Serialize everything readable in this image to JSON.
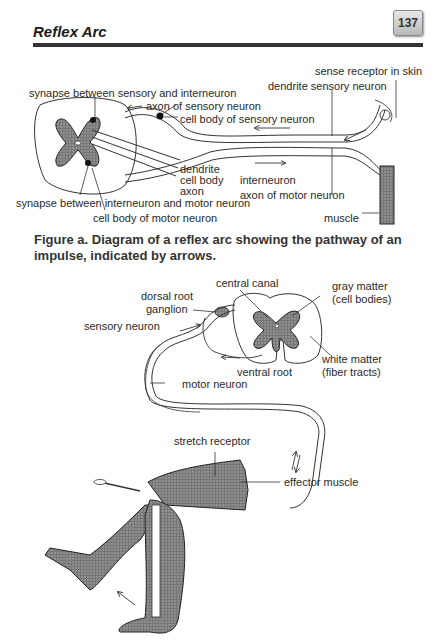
{
  "header": {
    "title": "Reflex Arc",
    "page_number": "137"
  },
  "figure_a": {
    "labels": {
      "sense_receptor": "sense receptor in skin",
      "dendrite_sensory": "dendrite sensory neuron",
      "synapse_sensory_inter": "synapse between sensory and interneuron",
      "axon_sensory": "axon of sensory neuron",
      "cell_body_sensory": "cell body of sensory neuron",
      "dendrite": "dendrite",
      "cell_body": "cell body",
      "axon": "axon",
      "interneuron": "interneuron",
      "axon_motor": "axon of motor neuron",
      "synapse_inter_motor": "synapse between interneuron and motor neuron",
      "cell_body_motor": "cell body of motor neuron",
      "muscle": "muscle"
    },
    "caption": "Figure a.  Diagram of a reflex arc showing the pathway of an impulse, indicated by arrows."
  },
  "figure_b": {
    "labels": {
      "central_canal": "central canal",
      "gray_matter": "gray matter",
      "gray_matter_sub": "(cell bodies)",
      "dorsal_root": "dorsal root",
      "ganglion": "ganglion",
      "sensory_neuron": "sensory neuron",
      "white_matter": "white matter",
      "white_matter_sub": "(fiber tracts)",
      "ventral_root": "ventral root",
      "motor_neuron": "motor neuron",
      "stretch_receptor": "stretch receptor",
      "effector_muscle": "effector muscle"
    }
  }
}
